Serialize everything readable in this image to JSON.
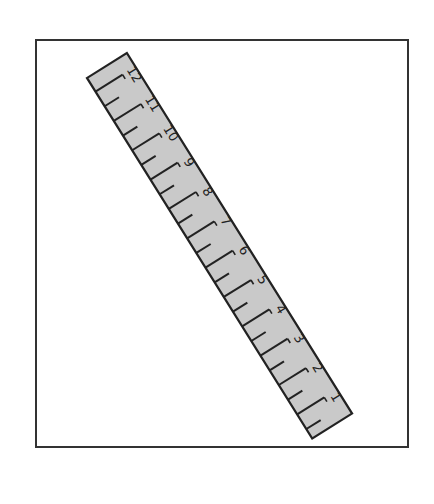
{
  "figure": {
    "frame_color": "#333333",
    "background": "#ffffff"
  },
  "ruler": {
    "fill": "#c9c9c9",
    "stroke": "#222222",
    "corners": {
      "top_left": [
        87,
        78
      ],
      "top_right": [
        127,
        53
      ],
      "bottom_right": [
        359,
        409
      ],
      "bottom_left": [
        320,
        434
      ]
    },
    "length_px": 425,
    "width_px": 47,
    "rotation_deg": -32,
    "inch_spacing_px": 34.6,
    "first_inch_offset_px": 16,
    "labels": [
      "12",
      "11",
      "10",
      "9",
      "8",
      "7",
      "6",
      "5",
      "4",
      "3",
      "2",
      "1"
    ]
  }
}
